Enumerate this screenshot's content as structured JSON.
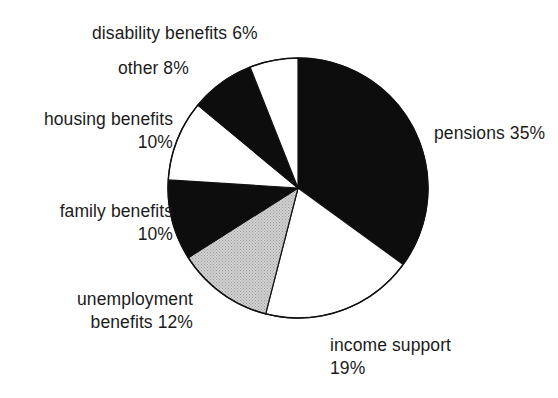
{
  "figure": {
    "background_color": "#ffffff",
    "outline_color": "#111111",
    "center_x": 298,
    "center_y": 188,
    "radius": 130
  },
  "labels": {
    "disability": "disability benefits 6%",
    "other": "other 8%",
    "housing": "housing benefits\n10%",
    "family": "family benefits\n10%",
    "unemployment": "unemployment\nbenefits 12%",
    "income_support": "income support\n19%",
    "pensions": "pensions 35%"
  },
  "chart_data": {
    "type": "pie",
    "title": "",
    "subtitle": "",
    "xlabel": "",
    "ylabel": "",
    "legend_position": "none",
    "labels_position": "outside-callout",
    "grid": false,
    "units": "percent",
    "total": 100,
    "start_angle_deg": 0,
    "direction": "clockwise",
    "categories": [
      "pensions",
      "income support",
      "unemployment benefits",
      "family benefits",
      "housing benefits",
      "other",
      "disability benefits"
    ],
    "values": [
      35,
      19,
      12,
      10,
      10,
      8,
      6
    ],
    "slices": [
      {
        "name": "pensions",
        "label": "pensions 35%",
        "value": 35,
        "fill": "#0d0d0d",
        "fill_name": "black",
        "start_deg": 0,
        "end_deg": 126
      },
      {
        "name": "income support",
        "label": "income support 19%",
        "value": 19,
        "fill": "#ffffff",
        "fill_name": "white",
        "start_deg": 126,
        "end_deg": 194.4
      },
      {
        "name": "unemployment benefits",
        "label": "unemployment benefits 12%",
        "value": 12,
        "fill": "#c9c9c9",
        "fill_name": "grey",
        "start_deg": 194.4,
        "end_deg": 237.6
      },
      {
        "name": "family benefits",
        "label": "family benefits 10%",
        "value": 10,
        "fill": "#0d0d0d",
        "fill_name": "black",
        "start_deg": 237.6,
        "end_deg": 273.6
      },
      {
        "name": "housing benefits",
        "label": "housing benefits 10%",
        "value": 10,
        "fill": "#ffffff",
        "fill_name": "white",
        "start_deg": 273.6,
        "end_deg": 309.6
      },
      {
        "name": "other",
        "label": "other 8%",
        "value": 8,
        "fill": "#0d0d0d",
        "fill_name": "black",
        "start_deg": 309.6,
        "end_deg": 338.4
      },
      {
        "name": "disability benefits",
        "label": "disability benefits 6%",
        "value": 6,
        "fill": "#ffffff",
        "fill_name": "white",
        "start_deg": 338.4,
        "end_deg": 360
      }
    ]
  }
}
